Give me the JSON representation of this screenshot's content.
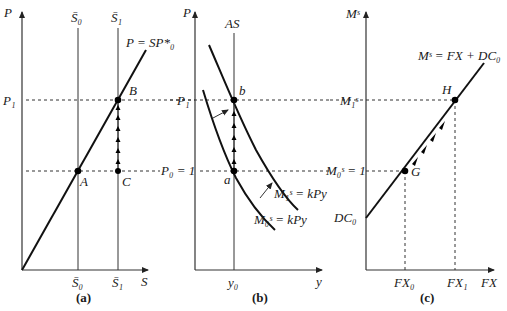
{
  "figure": {
    "panels": [
      {
        "id": "a",
        "caption": "(a)",
        "y_axis_label": "P",
        "x_axis_label": "S",
        "lines": {
          "price_line_label": "P = SP*₀",
          "stock_0_label": "S̄₀",
          "stock_1_label": "S̄₁"
        },
        "levels": {
          "p1": "P₁",
          "p0": "P₀ = 1"
        },
        "points": [
          "A",
          "B",
          "C"
        ],
        "x_ticks": [
          "S̄₀",
          "S̄₁"
        ]
      },
      {
        "id": "b",
        "caption": "(b)",
        "y_axis_label": "P",
        "x_axis_label": "y",
        "lines": {
          "supply_label": "AS",
          "demand_1_label": "M₁ˢ = kPy",
          "demand_0_label": "M₀ˢ = kPy"
        },
        "levels": {
          "p1": "P₁",
          "p0": "P₀ = 1"
        },
        "points": [
          "a",
          "b"
        ],
        "x_ticks": [
          "y₀"
        ]
      },
      {
        "id": "c",
        "caption": "(c)",
        "y_axis_label": "Mˢ",
        "x_axis_label": "FX",
        "lines": {
          "money_supply_label": "Mˢ = FX + DC₀",
          "intercept_label": "DC₀"
        },
        "levels": {
          "m1": "M₁ˢ",
          "m0": "M₀ˢ = 1"
        },
        "points": [
          "G",
          "H"
        ],
        "x_ticks": [
          "FX₀",
          "FX₁"
        ]
      }
    ]
  }
}
